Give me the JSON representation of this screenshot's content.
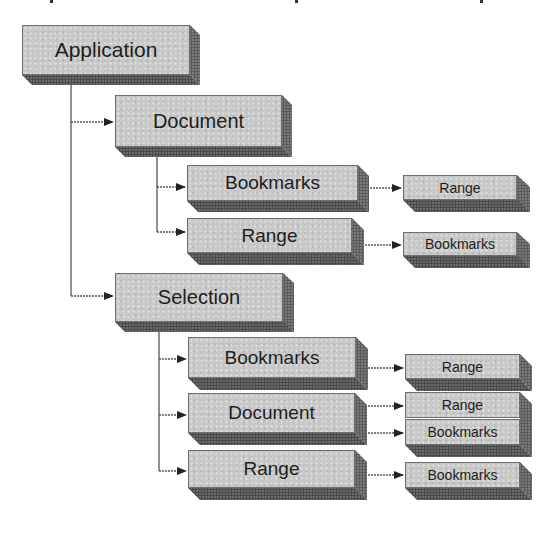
{
  "diagram": {
    "type": "object-model-hierarchy",
    "root": "Application",
    "nodes": [
      {
        "id": "application",
        "label": "Application",
        "level": 0,
        "parent": null
      },
      {
        "id": "document",
        "label": "Document",
        "level": 1,
        "parent": "application"
      },
      {
        "id": "document-bookmarks",
        "label": "Bookmarks",
        "level": 2,
        "parent": "document"
      },
      {
        "id": "document-bookmarks-range",
        "label": "Range",
        "level": 3,
        "parent": "document-bookmarks"
      },
      {
        "id": "document-range",
        "label": "Range",
        "level": 2,
        "parent": "document"
      },
      {
        "id": "document-range-bookmarks",
        "label": "Bookmarks",
        "level": 3,
        "parent": "document-range"
      },
      {
        "id": "selection",
        "label": "Selection",
        "level": 1,
        "parent": "application"
      },
      {
        "id": "selection-bookmarks",
        "label": "Bookmarks",
        "level": 2,
        "parent": "selection"
      },
      {
        "id": "selection-bookmarks-range",
        "label": "Range",
        "level": 3,
        "parent": "selection-bookmarks"
      },
      {
        "id": "selection-document",
        "label": "Document",
        "level": 2,
        "parent": "selection"
      },
      {
        "id": "selection-document-range",
        "label": "Range",
        "level": 3,
        "parent": "selection-document"
      },
      {
        "id": "selection-document-bookmarks",
        "label": "Bookmarks",
        "level": 3,
        "parent": "selection-document"
      },
      {
        "id": "selection-range",
        "label": "Range",
        "level": 2,
        "parent": "selection"
      },
      {
        "id": "selection-range-bookmarks",
        "label": "Bookmarks",
        "level": 3,
        "parent": "selection-range"
      }
    ]
  },
  "labels": {
    "application": "Application",
    "document": "Document",
    "document_bookmarks": "Bookmarks",
    "document_bookmarks_range": "Range",
    "document_range": "Range",
    "document_range_bookmarks": "Bookmarks",
    "selection": "Selection",
    "selection_bookmarks": "Bookmarks",
    "selection_bookmarks_range": "Range",
    "selection_document": "Document",
    "selection_document_range": "Range",
    "selection_document_bookmarks": "Bookmarks",
    "selection_range": "Range",
    "selection_range_bookmarks": "Bookmarks"
  },
  "colors": {
    "box_face": "#c8c8c8",
    "box_side": "#7a7a7a",
    "box_bottom": "#6a6a6a",
    "connector": "#555555",
    "text": "#1e1e1e",
    "background": "#ffffff"
  }
}
